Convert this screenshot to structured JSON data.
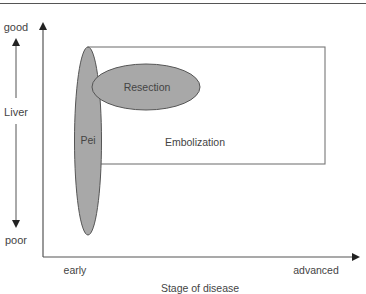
{
  "diagram": {
    "y_axis": {
      "title": "Liver",
      "top_label": "good",
      "bottom_label": "poor"
    },
    "x_axis": {
      "title": "Stage of disease",
      "left_label": "early",
      "right_label": "advanced"
    },
    "regions": [
      {
        "label": "Pei",
        "shape": "ellipse",
        "fill": "#a8a8a8"
      },
      {
        "label": "Resection",
        "shape": "ellipse",
        "fill": "#a8a8a8"
      },
      {
        "label": "Embolization",
        "shape": "rectangle",
        "fill": "#ffffff"
      }
    ],
    "colors": {
      "line": "#555555",
      "ellipse_fill": "#a8a8a8",
      "text": "#444444"
    }
  }
}
